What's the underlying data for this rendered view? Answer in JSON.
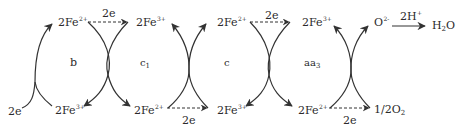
{
  "diagram": {
    "stroke_color": "#333333",
    "cytochromes": [
      {
        "id": "b",
        "label": "b"
      },
      {
        "id": "c1",
        "label": "c",
        "sub": "1"
      },
      {
        "id": "c",
        "label": "c"
      },
      {
        "id": "aa3",
        "label": "aa",
        "sub": "3"
      }
    ],
    "labels": {
      "b_top": {
        "base": "2Fe",
        "sup": "2+"
      },
      "b_bottom": {
        "base": "2Fe",
        "sup": "3+"
      },
      "b_input_e": {
        "base": "2e"
      },
      "b_c1_transfer_e": {
        "base": "2e"
      },
      "c1_top": {
        "base": "2Fe",
        "sup": "3+"
      },
      "c1_bottom": {
        "base": "2Fe",
        "sup": "2+"
      },
      "c1_c_transfer_e": {
        "base": "2e"
      },
      "c_top": {
        "base": "2Fe",
        "sup": "2+"
      },
      "c_bottom": {
        "base": "2Fe",
        "sup": "3+"
      },
      "c_aa3_transfer_e": {
        "base": "2e"
      },
      "aa3_top": {
        "base": "2Fe",
        "sup": "3+"
      },
      "aa3_bottom": {
        "base": "2Fe",
        "sup": "2+"
      },
      "aa3_o2_transfer_e": {
        "base": "2e"
      },
      "oxygen_in": {
        "base": "1/2O",
        "sub": "2"
      },
      "oxide": {
        "base": "O",
        "sup": "2-"
      },
      "protons": {
        "base": "2H",
        "sup": "+"
      },
      "water": {
        "base": "H",
        "sub": "2",
        "tail": "O"
      }
    }
  }
}
